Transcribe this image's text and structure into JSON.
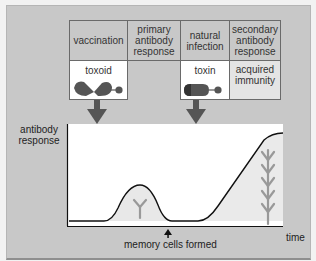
{
  "table": {
    "headers": [
      "vaccination",
      "primary antibody response",
      "natural infection",
      "secondary antibody response"
    ],
    "row2": [
      "toxoid",
      "",
      "toxin",
      "acquired immunity"
    ]
  },
  "axes": {
    "ylabel": "antibody response",
    "xlabel": "time",
    "annotation": "memory cells formed"
  },
  "colors": {
    "panel": "#c8c8c8",
    "plot": "#ffffff",
    "shape": "#555555",
    "arrow": "#555555",
    "curve": "#111111"
  },
  "icons": [
    "toxoid-molecule-icon",
    "toxin-molecule-icon",
    "down-arrow-icon",
    "antibody-icon",
    "up-arrow-icon"
  ]
}
